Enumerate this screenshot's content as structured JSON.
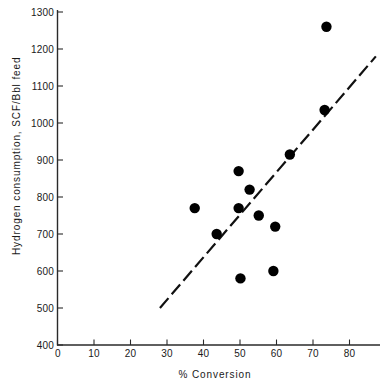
{
  "chart_data": {
    "type": "scatter",
    "title": "",
    "xlabel": "% Conversion",
    "ylabel": "Hydrogen consumption, SCF/Bbl feed",
    "xlim": [
      0,
      88
    ],
    "ylim": [
      400,
      1300
    ],
    "xticks": [
      0,
      10,
      20,
      30,
      40,
      50,
      60,
      70,
      80
    ],
    "xtick_labels": [
      "0",
      "10",
      "20",
      "30",
      "40",
      "50",
      "60",
      "70",
      "80"
    ],
    "yticks": [
      400,
      500,
      600,
      700,
      800,
      900,
      1000,
      1100,
      1200,
      1300
    ],
    "ytick_labels": [
      "400",
      "500",
      "600",
      "700",
      "800",
      "900",
      "1000",
      "1100",
      "1200",
      "1300"
    ],
    "grid": false,
    "legend": null,
    "marker_color": "#000000",
    "marker_size": 5.2,
    "series": [
      {
        "name": "Hydrogen consumption vs conversion",
        "marker": "filled-circle",
        "points": [
          {
            "x": 37.5,
            "y": 770
          },
          {
            "x": 43.5,
            "y": 700
          },
          {
            "x": 49.5,
            "y": 870
          },
          {
            "x": 49.5,
            "y": 770
          },
          {
            "x": 50.0,
            "y": 580
          },
          {
            "x": 52.5,
            "y": 820
          },
          {
            "x": 55.0,
            "y": 750
          },
          {
            "x": 59.0,
            "y": 600
          },
          {
            "x": 59.5,
            "y": 720
          },
          {
            "x": 63.5,
            "y": 915
          },
          {
            "x": 73.0,
            "y": 1035
          },
          {
            "x": 73.5,
            "y": 1260
          }
        ]
      }
    ],
    "trendline": {
      "style": "dashed",
      "color": "#111111",
      "x_start": 28.0,
      "y_start": 500,
      "x_end": 87.0,
      "y_end": 1180
    }
  },
  "axes": {
    "y_axis_name": "y-axis",
    "x_axis_name": "x-axis"
  }
}
